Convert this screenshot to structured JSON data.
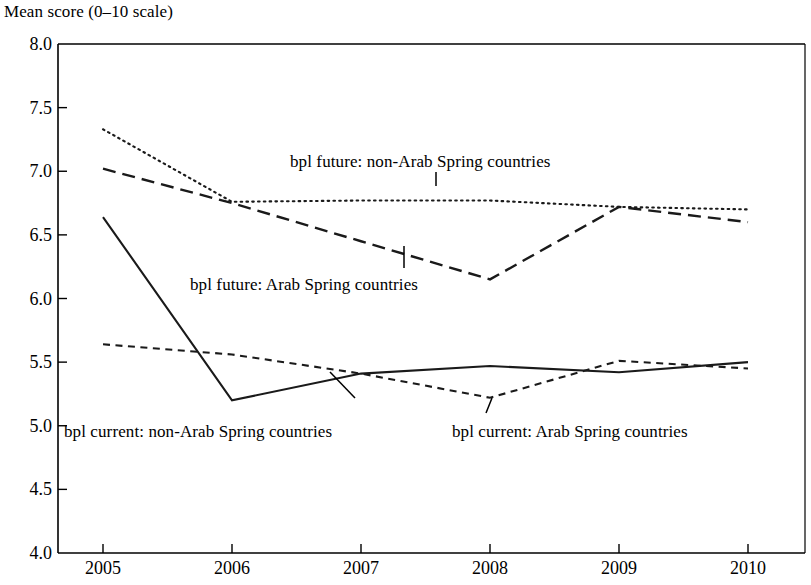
{
  "chart_data": {
    "type": "line",
    "title": "Mean score (0–10 scale)",
    "xlabel": "",
    "ylabel": "Mean score (0–10 scale)",
    "x": [
      2005,
      2006,
      2007,
      2008,
      2009,
      2010
    ],
    "xtick_labels": [
      "2005",
      "2006",
      "2007",
      "2008",
      "2009",
      "2010"
    ],
    "ytick_labels": [
      "8.0",
      "7.5",
      "7.0",
      "6.5",
      "6.0",
      "5.5",
      "5.0",
      "4.5",
      "4.0"
    ],
    "ytick_values": [
      8.0,
      7.5,
      7.0,
      6.5,
      6.0,
      5.5,
      5.0,
      4.5,
      4.0
    ],
    "xlim": [
      2005,
      2010
    ],
    "ylim": [
      4.0,
      8.0
    ],
    "grid": false,
    "legend": "inline-annotations",
    "series": [
      {
        "name": "bpl future: non-Arab Spring countries",
        "style": "dotted",
        "values": [
          7.33,
          6.76,
          6.77,
          6.77,
          6.72,
          6.7
        ]
      },
      {
        "name": "bpl future: Arab Spring countries",
        "style": "long-dashed",
        "values": [
          7.02,
          6.75,
          6.45,
          6.15,
          6.72,
          6.6
        ]
      },
      {
        "name": "bpl current: non-Arab Spring countries",
        "style": "solid",
        "values": [
          6.64,
          5.2,
          5.41,
          5.47,
          5.42,
          5.5
        ]
      },
      {
        "name": "bpl current: Arab Spring countries",
        "style": "short-dashed",
        "values": [
          5.64,
          5.56,
          5.41,
          5.22,
          5.51,
          5.45
        ]
      }
    ],
    "annotations": [
      {
        "id": "annot-future-nonarab",
        "text": "bpl future: non-Arab Spring countries",
        "x": 290,
        "y": 152
      },
      {
        "id": "annot-future-arab",
        "text": "bpl future: Arab Spring countries",
        "x": 190,
        "y": 275
      },
      {
        "id": "annot-current-nonarab",
        "text": "bpl current: non-Arab Spring countries",
        "x": 64,
        "y": 422
      },
      {
        "id": "annot-current-arab",
        "text": "bpl current: Arab Spring countries",
        "x": 452,
        "y": 422
      }
    ],
    "colors": {
      "line": "#1a1a1a",
      "axis": "#000000",
      "background": "#ffffff"
    }
  }
}
